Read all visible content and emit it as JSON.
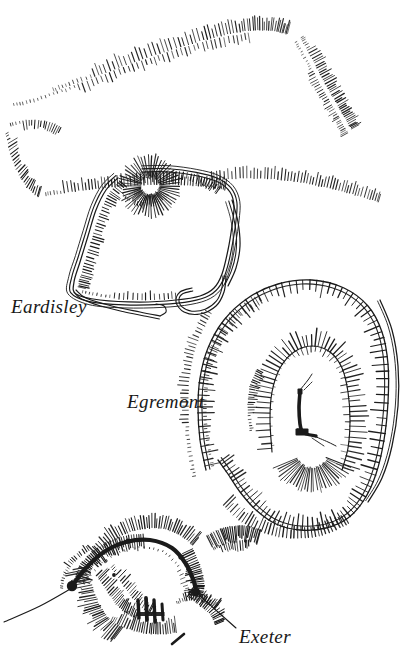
{
  "plate": {
    "medium": "line-engraving",
    "ink_color": "#1a1a1a",
    "paper_color": "#ffffff",
    "width": 403,
    "height": 656
  },
  "labels": {
    "eardisley": "Eardisley",
    "egremont": "Egremont",
    "exeter": "Exeter"
  },
  "plans": [
    {
      "id": "eardisley",
      "name": "Eardisley",
      "features": [
        "motte",
        "bailey-rampart",
        "outer-scarps",
        "ditch-tails"
      ]
    },
    {
      "id": "egremont",
      "name": "Egremont",
      "features": [
        "outer-rampart",
        "inner-ward",
        "masonry-fragment"
      ]
    },
    {
      "id": "exeter",
      "name": "Exeter",
      "features": [
        "curtain-wall",
        "mound-scarp",
        "towers",
        "leader-lines"
      ]
    }
  ]
}
